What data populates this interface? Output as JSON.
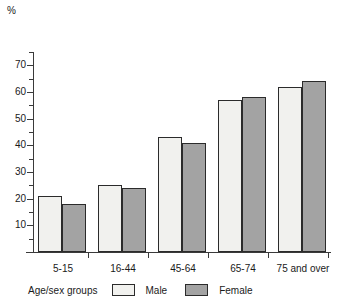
{
  "chart_data": {
    "type": "bar",
    "title": "",
    "subtitle": "",
    "unit_label": "%",
    "xlabel": "Age/sex groups",
    "ylabel": "",
    "ylim": [
      0,
      75
    ],
    "y_major_ticks": [
      10,
      20,
      30,
      40,
      50,
      60,
      70
    ],
    "y_minor_ticks": [
      5,
      15,
      25,
      35,
      45,
      55,
      65,
      75
    ],
    "y_tick_labels": [
      "10",
      "20",
      "30",
      "40",
      "50",
      "60",
      "70"
    ],
    "grid": false,
    "legend_position": "bottom",
    "categories": [
      "5-15",
      "16-44",
      "45-64",
      "65-74",
      "75 and over"
    ],
    "series": [
      {
        "name": "Male",
        "color": "#f1f1ee",
        "values": [
          21,
          25,
          43,
          57,
          62
        ]
      },
      {
        "name": "Female",
        "color": "#a3a3a3",
        "values": [
          18,
          24,
          41,
          58,
          64
        ]
      }
    ]
  },
  "legend": {
    "title": "Age/sex groups",
    "entries": [
      {
        "label": "Male",
        "swatch": "male"
      },
      {
        "label": "Female",
        "swatch": "female"
      }
    ]
  },
  "colors": {
    "male_fill": "#f1f1ee",
    "female_fill": "#a3a3a3",
    "bar_outline": "#2b2b2b",
    "axis": "#3a3a3a",
    "background": "#ffffff"
  }
}
